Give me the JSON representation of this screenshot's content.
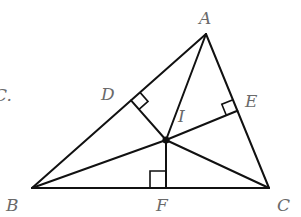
{
  "diagram": {
    "colors": {
      "line": "#111111",
      "label": "#6a6a6a",
      "background": "#ffffff"
    },
    "points": {
      "A": {
        "label": "A",
        "x": 206,
        "y": 34
      },
      "B": {
        "label": "B",
        "x": 32,
        "y": 188
      },
      "C": {
        "label": "C",
        "x": 269,
        "y": 188
      },
      "I": {
        "label": "I",
        "x": 166,
        "y": 140
      },
      "D": {
        "label": "D",
        "x": 131,
        "y": 100
      },
      "E": {
        "label": "E",
        "x": 237,
        "y": 111
      },
      "F": {
        "label": "F",
        "x": 166,
        "y": 188
      }
    },
    "left_fragment": "C."
  }
}
